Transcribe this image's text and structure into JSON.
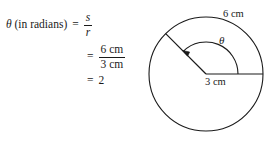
{
  "figure": {
    "background_color": "#ffffff",
    "stroke_color": "#1a1a1a",
    "width": 274,
    "height": 148
  },
  "equation": {
    "line1": {
      "lhs_symbol": "θ",
      "lhs_qualifier": "(in radians)",
      "equals": "=",
      "fraction_numerator": "s",
      "fraction_denominator": "r"
    },
    "line2": {
      "equals": "=",
      "fraction_numerator": "6 cm",
      "fraction_denominator": "3 cm"
    },
    "line3": {
      "equals": "=",
      "value": "2"
    }
  },
  "diagram": {
    "type": "circle-with-central-angle",
    "arc_length_label": "6 cm",
    "radius_label": "3 cm",
    "angle_label": "θ",
    "center": [
      69,
      74
    ],
    "radius_px": 57,
    "initial_ray_angle_deg": 0,
    "terminal_ray_angle_deg": 135,
    "angle_arc_direction": "counterclockwise"
  }
}
